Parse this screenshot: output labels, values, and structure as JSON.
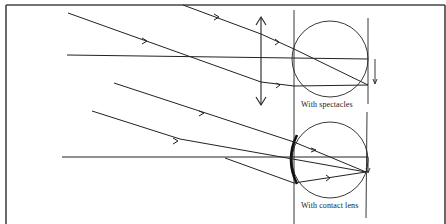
{
  "diagram": {
    "type": "optics-ray-diagram",
    "colors": {
      "ink": "#222222",
      "background": "#ffffff"
    },
    "panels": [
      {
        "id": "spectacles",
        "label": "With spectacles",
        "lens": "spectacle-lens-double-arrow",
        "eye": "circle"
      },
      {
        "id": "contact",
        "label": "With contact lens",
        "lens": "contact-lens-arc",
        "eye": "circle"
      }
    ]
  },
  "labels": {
    "spectacles": "With spectacles",
    "contact": "With contact lens"
  }
}
